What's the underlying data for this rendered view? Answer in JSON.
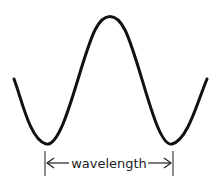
{
  "diagram": {
    "type": "wave",
    "label": "wavelength",
    "stroke_color": "#111111",
    "arrows": {
      "left": "left-arrow",
      "right": "right-arrow"
    }
  }
}
